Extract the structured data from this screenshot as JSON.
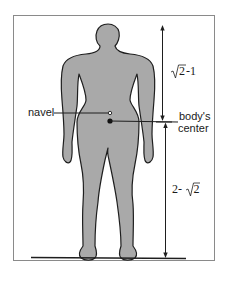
{
  "diagram": {
    "labels": {
      "navel": "navel",
      "body_center_line1": "body's",
      "body_center_line2": "center",
      "upper_measure_radical": "2",
      "upper_measure_suffix": "-1",
      "lower_measure_prefix": "2-",
      "lower_measure_radical": "2"
    },
    "measurements": [
      {
        "name": "upper",
        "expression": "√2-1",
        "from": "top of head",
        "to": "body's center"
      },
      {
        "name": "lower",
        "expression": "2-√2",
        "from": "body's center",
        "to": "ground"
      }
    ],
    "colors": {
      "body_fill": "#a9a9a9",
      "outline": "#1e1e1e",
      "frame": "#8a8a8a",
      "background": "#ffffff"
    }
  }
}
